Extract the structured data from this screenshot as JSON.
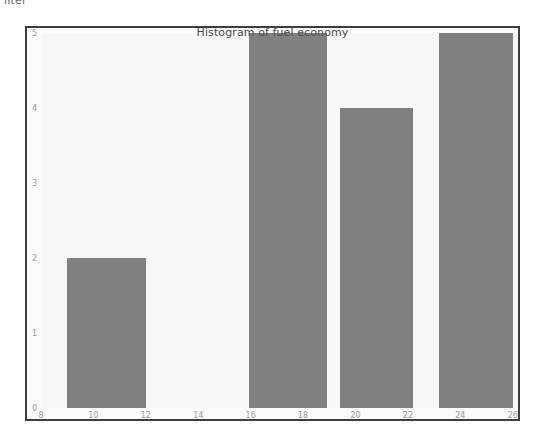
{
  "page": {
    "clipped_top_text": "ilter"
  },
  "chart_data": {
    "type": "bar",
    "title": "Histogram of fuel economy",
    "xlabel": "",
    "ylabel": "",
    "grid": false,
    "legend": null,
    "xlim": [
      8,
      26.2
    ],
    "ylim": [
      0,
      5
    ],
    "xticks": [
      8,
      10,
      12,
      14,
      16,
      18,
      20,
      22,
      24,
      26
    ],
    "xtick_labels": [
      "8",
      "10",
      "12",
      "14",
      "16",
      "18",
      "20",
      "22",
      "24",
      "26"
    ],
    "yticks": [
      0,
      1,
      2,
      3,
      4,
      5
    ],
    "ytick_labels": [
      "0",
      "1",
      "2",
      "3",
      "4",
      "5"
    ],
    "bar_color": "#808080",
    "background_color": "#f7f7f7",
    "frame_color": "#3d3d3d",
    "bins": [
      {
        "label": "9.0-12.0",
        "x_start": 9.0,
        "x_end": 12.0,
        "value": 2
      },
      {
        "label": "16.0-18.9",
        "x_start": 15.95,
        "x_end": 18.9,
        "value": 5
      },
      {
        "label": "19.4-22.2",
        "x_start": 19.4,
        "x_end": 22.2,
        "value": 4
      },
      {
        "label": "23.2-26.0",
        "x_start": 23.2,
        "x_end": 26.0,
        "value": 5
      }
    ],
    "categories": [
      "9.0-12.0",
      "16.0-18.9",
      "19.4-22.2",
      "23.2-26.0"
    ],
    "values": [
      2,
      5,
      4,
      5
    ]
  }
}
